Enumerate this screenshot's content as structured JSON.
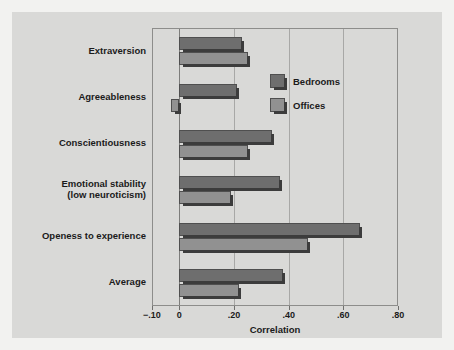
{
  "chart_data": {
    "type": "bar",
    "orientation": "horizontal",
    "title": "",
    "xlabel": "Correlation",
    "ylabel": "",
    "xlim": [
      -0.1,
      0.8
    ],
    "xticks": [
      -0.1,
      0,
      0.2,
      0.4,
      0.6,
      0.8
    ],
    "xticklabels": [
      "−.10",
      "0",
      ".20",
      ".40",
      ".60",
      ".80"
    ],
    "gridlines": [
      0,
      0.2,
      0.4,
      0.6
    ],
    "grid": true,
    "legend_position": "inside-upper-right",
    "categories": [
      "Extraversion",
      "Agreeableness",
      "Conscientiousness",
      "Emotional stability (low neuroticism)",
      "Openess to experience",
      "Average"
    ],
    "category_labels": [
      [
        "Extraversion"
      ],
      [
        "Agreeableness"
      ],
      [
        "Conscientiousness"
      ],
      [
        "Emotional stability",
        "(low neuroticism)"
      ],
      [
        "Openess to experience"
      ],
      [
        "Average"
      ]
    ],
    "series": [
      {
        "name": "Bedrooms",
        "color": "#6e6e6e",
        "values": [
          0.23,
          0.21,
          0.34,
          0.37,
          0.66,
          0.38
        ]
      },
      {
        "name": "Offices",
        "color": "#919191",
        "values": [
          0.25,
          -0.03,
          0.25,
          0.19,
          0.47,
          0.22
        ]
      }
    ]
  },
  "colors": {
    "page_background": "#f2f2f0",
    "panel_background": "#d9d9d7",
    "axis": "#8d8d8b",
    "grid": "#a8a8a6",
    "text": "#1b1b1b",
    "bedrooms": "#6e6e6e",
    "offices": "#919191"
  }
}
